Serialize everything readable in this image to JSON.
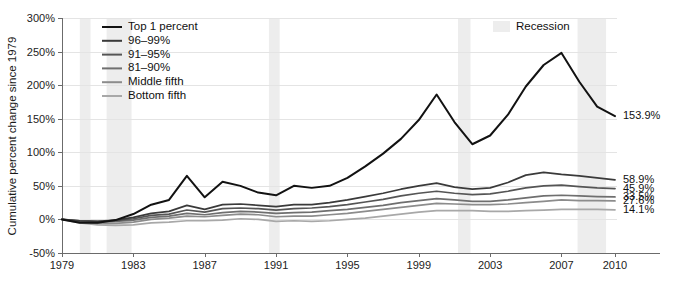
{
  "chart_data": {
    "type": "line",
    "title": "",
    "subtitle": "",
    "xlabel": "",
    "ylabel": "Cumulative percent change since 1979",
    "xlim": [
      1979,
      2010
    ],
    "ylim": [
      -50,
      300
    ],
    "grid": true,
    "grid_axis": "y",
    "legend_position": "top-left",
    "y_ticks": [
      -50,
      0,
      50,
      100,
      150,
      200,
      250,
      300
    ],
    "y_tick_labels": [
      "-50%",
      "0%",
      "50%",
      "100%",
      "150%",
      "200%",
      "250%",
      "300%"
    ],
    "x_ticks": [
      1979,
      1983,
      1987,
      1991,
      1995,
      1999,
      2003,
      2007,
      2010
    ],
    "x_tick_labels": [
      "1979",
      "1983",
      "1987",
      "1991",
      "1995",
      "1999",
      "2003",
      "2007",
      "2010"
    ],
    "x": [
      1979,
      1980,
      1981,
      1982,
      1983,
      1984,
      1985,
      1986,
      1987,
      1988,
      1989,
      1990,
      1991,
      1992,
      1993,
      1994,
      1995,
      1996,
      1997,
      1998,
      1999,
      2000,
      2001,
      2002,
      2003,
      2004,
      2005,
      2006,
      2007,
      2008,
      2009,
      2010
    ],
    "series": [
      {
        "name": "Top 1 percent",
        "color": "#121212",
        "width": 2.0,
        "end_label": "153.9%",
        "end_value": 153.9,
        "values": [
          0,
          -5,
          -5,
          -1,
          8,
          22,
          29,
          65,
          33,
          56,
          50,
          40,
          36,
          50,
          47,
          50,
          62,
          79,
          98,
          120,
          148,
          186,
          145,
          112,
          125,
          156,
          198,
          230,
          248,
          205,
          168,
          153.9
        ]
      },
      {
        "name": "96–99%",
        "color": "#3a3a3a",
        "width": 1.7,
        "end_label": "58.9%",
        "end_value": 58.9,
        "values": [
          0,
          -2,
          -3,
          -1,
          3,
          9,
          12,
          21,
          15,
          22,
          23,
          21,
          19,
          22,
          22,
          25,
          29,
          34,
          39,
          45,
          50,
          54,
          48,
          45,
          47,
          55,
          66,
          70,
          67,
          65,
          62,
          58.9
        ]
      },
      {
        "name": "91–95%",
        "color": "#555555",
        "width": 1.7,
        "end_label": "45.9%",
        "end_value": 45.9,
        "values": [
          0,
          -2,
          -3,
          -2,
          1,
          6,
          8,
          14,
          11,
          16,
          17,
          16,
          14,
          16,
          17,
          19,
          22,
          26,
          30,
          35,
          39,
          42,
          39,
          37,
          38,
          42,
          47,
          50,
          51,
          49,
          47,
          45.9
        ]
      },
      {
        "name": "81–90%",
        "color": "#6f6f6f",
        "width": 1.7,
        "end_label": "33.5%",
        "end_value": 33.5,
        "values": [
          0,
          -3,
          -4,
          -3,
          -1,
          3,
          5,
          9,
          7,
          10,
          12,
          11,
          9,
          10,
          11,
          13,
          15,
          18,
          21,
          25,
          28,
          31,
          29,
          27,
          27,
          29,
          32,
          35,
          36,
          35,
          34,
          33.5
        ]
      },
      {
        "name": "Middle fifth",
        "color": "#8c8c8c",
        "width": 1.7,
        "end_label": "27.6%",
        "end_value": 27.6,
        "values": [
          0,
          -4,
          -6,
          -6,
          -4,
          0,
          2,
          5,
          4,
          6,
          8,
          7,
          4,
          5,
          5,
          7,
          9,
          12,
          15,
          18,
          21,
          24,
          23,
          22,
          22,
          23,
          25,
          27,
          29,
          28,
          28,
          27.6
        ]
      },
      {
        "name": "Bottom fifth",
        "color": "#a8a8a8",
        "width": 1.7,
        "end_label": "14.1%",
        "end_value": 14.1,
        "values": [
          0,
          -5,
          -8,
          -9,
          -8,
          -5,
          -4,
          -2,
          -2,
          -1,
          1,
          0,
          -3,
          -2,
          -3,
          -2,
          0,
          2,
          5,
          8,
          11,
          13,
          13,
          13,
          12,
          12,
          13,
          14,
          15,
          15,
          15,
          14.1
        ]
      }
    ],
    "recessions": [
      {
        "start": 1980.0,
        "end": 1980.6
      },
      {
        "start": 1981.5,
        "end": 1982.9
      },
      {
        "start": 1990.6,
        "end": 1991.2
      },
      {
        "start": 2001.2,
        "end": 2001.9
      },
      {
        "start": 2007.9,
        "end": 2009.5
      }
    ],
    "recession_legend_label": "Recession",
    "recession_color": "#ededed",
    "annotations": []
  }
}
